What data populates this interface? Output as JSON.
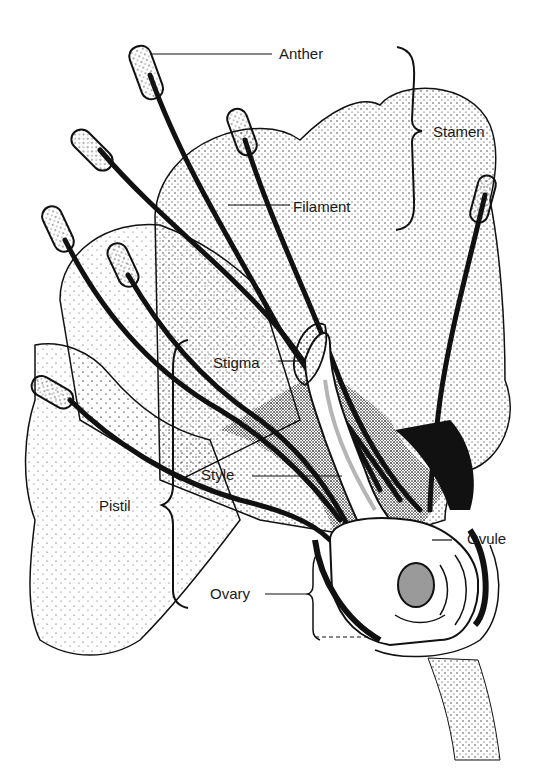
{
  "diagram": {
    "colors": {
      "ink": "#111111",
      "petal_stipple": "#8a8a8a",
      "background": "#ffffff",
      "ovule_fill": "#9a9a9a",
      "style_stripe": "#b5b5b5"
    },
    "labels": {
      "anther": "Anther",
      "stamen": "Stamen",
      "filament": "Filament",
      "stigma": "Stigma",
      "style": "Style",
      "pistil": "Pistil",
      "ovule": "Ovule",
      "ovary": "Ovary"
    },
    "groupings": {
      "stamen": [
        "Anther",
        "Filament"
      ],
      "pistil": [
        "Stigma",
        "Style",
        "Ovary"
      ]
    }
  }
}
